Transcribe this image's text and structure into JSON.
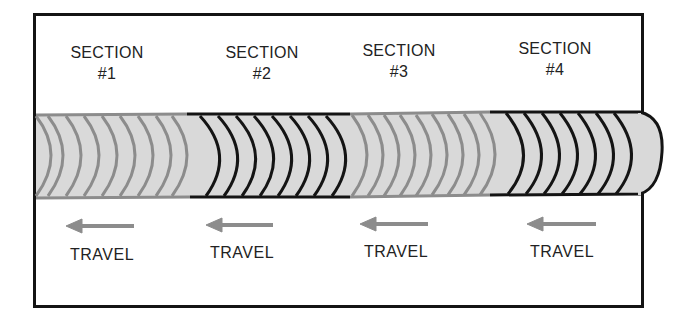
{
  "diagram": {
    "colors": {
      "frame": "#141414",
      "bead_fill": "#d9d9d9",
      "light_ripple": "#8c8c8c",
      "dark_ripple": "#141414",
      "arrow": "#8c8c8c"
    },
    "sections": [
      {
        "title": "SECTION",
        "number": "#1",
        "ripple_style": "light",
        "travel_label": "TRAVEL",
        "arrow_direction": "left"
      },
      {
        "title": "SECTION",
        "number": "#2",
        "ripple_style": "dark",
        "travel_label": "TRAVEL",
        "arrow_direction": "left"
      },
      {
        "title": "SECTION",
        "number": "#3",
        "ripple_style": "light",
        "travel_label": "TRAVEL",
        "arrow_direction": "left"
      },
      {
        "title": "SECTION",
        "number": "#4",
        "ripple_style": "dark",
        "travel_label": "TRAVEL",
        "arrow_direction": "left"
      }
    ]
  }
}
